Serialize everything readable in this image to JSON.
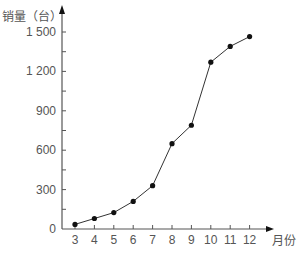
{
  "chart_data": {
    "type": "line",
    "title": "",
    "xlabel": "月份",
    "ylabel": "销量（台）",
    "x": [
      3,
      4,
      5,
      6,
      7,
      8,
      9,
      10,
      11,
      12
    ],
    "categories": [
      "3",
      "4",
      "5",
      "6",
      "7",
      "8",
      "9",
      "10",
      "11",
      "12"
    ],
    "series": [
      {
        "name": "销量",
        "values": [
          35,
          80,
          125,
          210,
          330,
          650,
          790,
          1270,
          1390,
          1465
        ]
      }
    ],
    "yticks": [
      0,
      300,
      600,
      900,
      1200,
      1500
    ],
    "ytick_labels": [
      "0",
      "300",
      "600",
      "900",
      "1 200",
      "1 500"
    ],
    "ylim": [
      0,
      1500
    ],
    "grid": false,
    "legend": "none",
    "markers": "filled-circle",
    "line_color": "#333333",
    "marker_color": "#111111"
  }
}
